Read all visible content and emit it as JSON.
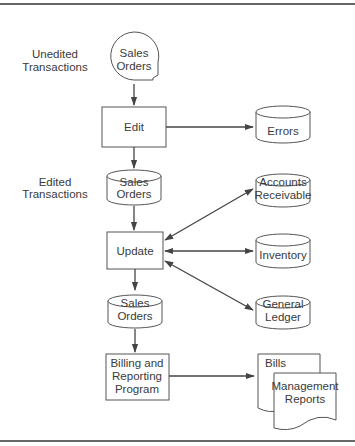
{
  "diagram": {
    "side_labels": {
      "unedited": [
        "Unedited",
        "Transactions"
      ],
      "edited": [
        "Edited",
        "Transactions"
      ]
    },
    "nodes": {
      "sales_orders_input": [
        "Sales",
        "Orders"
      ],
      "edit": "Edit",
      "errors": "Errors",
      "sales_orders_edited": [
        "Sales",
        "Orders"
      ],
      "accounts_receivable": [
        "Accounts",
        "Receivable"
      ],
      "update": "Update",
      "inventory": "Inventory",
      "general_ledger": [
        "General",
        "Ledger"
      ],
      "sales_orders_updated": [
        "Sales",
        "Orders"
      ],
      "billing": [
        "Billing and",
        "Reporting",
        "Program"
      ],
      "bills": "Bills",
      "management_reports": [
        "Management",
        "Reports"
      ]
    },
    "colors": {
      "line": "#444444",
      "fill": "#ffffff",
      "rule": "#666666"
    }
  }
}
